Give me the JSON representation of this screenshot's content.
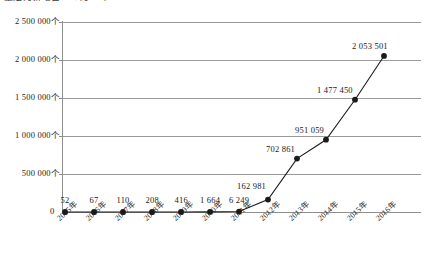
{
  "top_caption": "量定为新增自 4 个月 1 年 0",
  "chart_data": {
    "type": "line",
    "title": "",
    "xlabel": "",
    "ylabel": "",
    "categories": [
      "2005年",
      "2006年",
      "2007年",
      "2008年",
      "2009年",
      "2010年",
      "2011年",
      "2012年",
      "2013年",
      "2014年",
      "2015年",
      "2016年"
    ],
    "values": [
      52,
      67,
      110,
      208,
      416,
      1664,
      6249,
      162981,
      702861,
      951059,
      1477450,
      2053501
    ],
    "point_labels": [
      "52",
      "67",
      "110",
      "208",
      "416",
      "1 664",
      "6 249",
      "162 981",
      "702 861",
      "951 059",
      "1 477 450",
      "2 053 501"
    ],
    "ylim": [
      0,
      2500000
    ],
    "ytick_values": [
      0,
      500000,
      1000000,
      1500000,
      2000000,
      2500000
    ],
    "ytick_labels": [
      "0",
      "500 000个",
      "1 000 000个",
      "1 500 000个",
      "2 000 000个",
      "2 500 000个"
    ],
    "grid": true,
    "legend": "none",
    "unit_suffix": "个",
    "series_color": "#1a1a1a",
    "grid_color": "#9a9a9a",
    "marker": "circle"
  }
}
